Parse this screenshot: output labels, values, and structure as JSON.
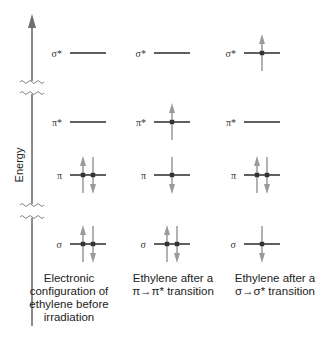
{
  "diagram": {
    "axis": {
      "label": "Energy",
      "x": 32,
      "top": 14,
      "bottom": 326,
      "color": "#6e6e6e",
      "breaks": [
        {
          "y1": 82,
          "y2": 93
        },
        {
          "y1": 205,
          "y2": 217
        }
      ]
    },
    "colors": {
      "level_line": "#2a2a2a",
      "arrow": "#9a9a9a",
      "electron": "#333333"
    },
    "level_rows": [
      {
        "key": "sigma_star",
        "label": "σ*",
        "y": 53
      },
      {
        "key": "pi_star",
        "label": "π*",
        "y": 122
      },
      {
        "key": "pi",
        "label": "π",
        "y": 175
      },
      {
        "key": "sigma",
        "label": "σ",
        "y": 244
      }
    ],
    "columns": [
      {
        "name": "ground-state",
        "label_x": 62,
        "line_x1": 70,
        "line_x2": 106,
        "caption": [
          "Electronic",
          "configuration of",
          "ethylene before",
          "irradiation"
        ],
        "occupancy": {
          "sigma_star": [],
          "pi_star": [],
          "pi": [
            "up",
            "down"
          ],
          "sigma": [
            "up",
            "down"
          ]
        }
      },
      {
        "name": "pi-pi-star",
        "label_x": 146,
        "line_x1": 154,
        "line_x2": 190,
        "caption": [
          "Ethylene after a",
          "π→π* transition"
        ],
        "occupancy": {
          "sigma_star": [],
          "pi_star": [
            "up"
          ],
          "pi": [
            "down"
          ],
          "sigma": [
            "up",
            "down"
          ]
        }
      },
      {
        "name": "sigma-sigma-star",
        "label_x": 236,
        "line_x1": 244,
        "line_x2": 280,
        "caption": [
          "Ethylene after a",
          "σ→σ* transition"
        ],
        "occupancy": {
          "sigma_star": [
            "up"
          ],
          "pi_star": [],
          "pi": [
            "up",
            "down"
          ],
          "sigma": [
            "down"
          ]
        }
      }
    ]
  }
}
